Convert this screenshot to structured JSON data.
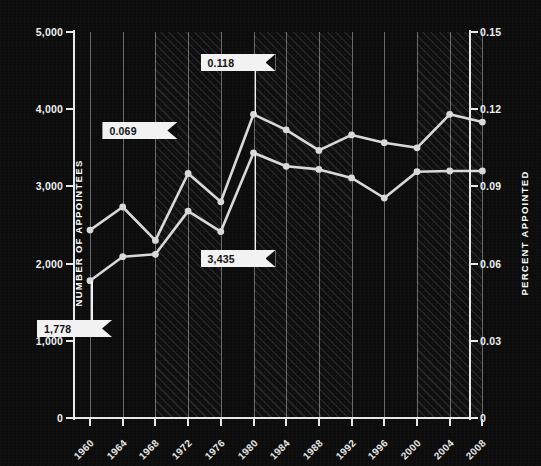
{
  "axes": {
    "left_title": "NUMBER OF APPOINTEES",
    "right_title": "PERCENT APPOINTED",
    "left_ticks": [
      "5,000",
      "4,000",
      "3,000",
      "2,000",
      "1,000",
      "0"
    ],
    "right_ticks": [
      "0.15",
      "0.12",
      "0.09",
      "0.06",
      "0.03",
      "0"
    ],
    "x_ticks": [
      "1960",
      "1964",
      "1968",
      "1972",
      "1976",
      "1980",
      "1984",
      "1988",
      "1992",
      "1996",
      "2000",
      "2004",
      "2008"
    ]
  },
  "callouts": [
    {
      "id": "pct-1968",
      "label": "0.069"
    },
    {
      "id": "pct-1980",
      "label": "0.118"
    },
    {
      "id": "count-1980",
      "label": "3,435"
    },
    {
      "id": "count-1960",
      "label": "1,778"
    }
  ],
  "colors": {
    "background": "#0c0c0c",
    "axis": "#e8e8e8",
    "series": "#d9d9d9",
    "gridline": "#ebebeb",
    "flag_fill": "#f2f2f2",
    "flag_text": "#111111"
  },
  "chart_data": {
    "type": "line",
    "title": "",
    "xlabel": "",
    "ylabel": "NUMBER OF APPOINTEES",
    "y2label": "PERCENT APPOINTED",
    "grid": true,
    "legend": "none",
    "x": [
      1960,
      1964,
      1968,
      1972,
      1976,
      1980,
      1984,
      1988,
      1992,
      1996,
      2000,
      2004,
      2008
    ],
    "ylim": [
      0,
      5000
    ],
    "y2lim": [
      0,
      0.15
    ],
    "series": [
      {
        "name": "PERCENT APPOINTED",
        "axis": "right",
        "values": [
          0.073,
          0.082,
          0.069,
          0.095,
          0.084,
          0.118,
          0.112,
          0.104,
          0.11,
          0.107,
          0.105,
          0.118,
          0.115
        ]
      },
      {
        "name": "NUMBER OF APPOINTEES",
        "axis": "left",
        "values": [
          1778,
          2090,
          2120,
          2680,
          2415,
          3435,
          3260,
          3220,
          3110,
          2850,
          3190,
          3200,
          3200
        ]
      }
    ],
    "annotations": [
      {
        "text": "0.069",
        "series": "PERCENT APPOINTED",
        "x": 1968,
        "y": 0.069
      },
      {
        "text": "0.118",
        "series": "PERCENT APPOINTED",
        "x": 1980,
        "y": 0.118
      },
      {
        "text": "3,435",
        "series": "NUMBER OF APPOINTEES",
        "x": 1980,
        "y": 3435
      },
      {
        "text": "1,778",
        "series": "NUMBER OF APPOINTEES",
        "x": 1960,
        "y": 1778
      }
    ],
    "shaded_bands": [
      {
        "from": 1968,
        "to": 1976
      },
      {
        "from": 1980,
        "to": 1992
      },
      {
        "from": 2000,
        "to": 2008
      }
    ]
  }
}
